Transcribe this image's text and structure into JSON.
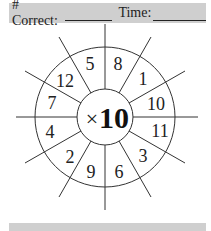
{
  "header": {
    "correct_label": "# Correct:",
    "time_label": "Time:"
  },
  "wheel": {
    "operator": "×",
    "multiplier": "10",
    "numbers": [
      "8",
      "1",
      "10",
      "11",
      "3",
      "6",
      "9",
      "2",
      "4",
      "7",
      "12",
      "5"
    ]
  },
  "colors": {
    "bar": "#cfcfcf",
    "line": "#333333"
  }
}
